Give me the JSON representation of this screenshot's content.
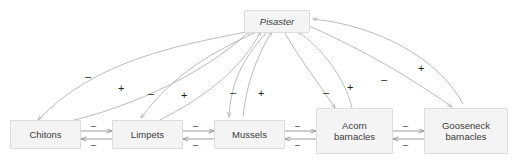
{
  "diagram": {
    "type": "food-web-diagram",
    "background_color": "#ffffff",
    "node_fill": "#f4f4f4",
    "node_border": "#dcdcdc",
    "edge_color": "#a9a9a9",
    "sign_color": "#1d1d1d"
  },
  "nodes": {
    "predator": {
      "label": "Pisaster",
      "italic": true
    },
    "prey": [
      {
        "id": "chitons",
        "label": "Chitons"
      },
      {
        "id": "limpets",
        "label": "Limpets"
      },
      {
        "id": "mussels",
        "label": "Mussels"
      },
      {
        "id": "acorn-barnacles",
        "line1": "Acorn",
        "line2": "barnacles"
      },
      {
        "id": "gooseneck-barnacles",
        "line1": "Gooseneck",
        "line2": "barnacles"
      }
    ]
  },
  "signs": {
    "minus": "–",
    "plus": "+"
  },
  "predation_links": [
    {
      "from": "Pisaster",
      "to": "Chitons",
      "sign": "–"
    },
    {
      "from": "Chitons",
      "to": "Pisaster",
      "sign": "+"
    },
    {
      "from": "Pisaster",
      "to": "Limpets",
      "sign": "–"
    },
    {
      "from": "Limpets",
      "to": "Pisaster",
      "sign": "+"
    },
    {
      "from": "Pisaster",
      "to": "Mussels",
      "sign": "–"
    },
    {
      "from": "Mussels",
      "to": "Pisaster",
      "sign": "+"
    },
    {
      "from": "Pisaster",
      "to": "Acorn barnacles",
      "sign": "–"
    },
    {
      "from": "Acorn barnacles",
      "to": "Pisaster",
      "sign": "+"
    },
    {
      "from": "Pisaster",
      "to": "Gooseneck barnacles",
      "sign": "–"
    },
    {
      "from": "Gooseneck barnacles",
      "to": "Pisaster",
      "sign": "+"
    }
  ],
  "competition_links": [
    {
      "between": [
        "Chitons",
        "Limpets"
      ],
      "sign_top": "–",
      "sign_bottom": "–"
    },
    {
      "between": [
        "Limpets",
        "Mussels"
      ],
      "sign_top": "–",
      "sign_bottom": "–"
    },
    {
      "between": [
        "Mussels",
        "Acorn barnacles"
      ],
      "sign_top": "–",
      "sign_bottom": "–"
    },
    {
      "between": [
        "Acorn barnacles",
        "Gooseneck barnacles"
      ],
      "sign_top": "–",
      "sign_bottom": "–"
    }
  ]
}
